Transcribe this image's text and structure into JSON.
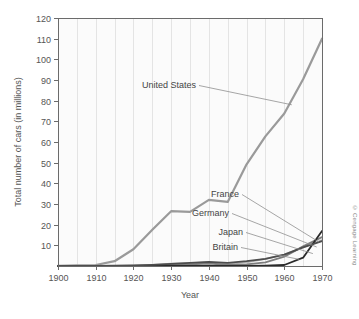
{
  "chart_data": {
    "type": "line",
    "title": "",
    "xlabel": "Year",
    "ylabel": "Total number of cars (in millions)",
    "xlim": [
      1900,
      1970
    ],
    "ylim": [
      0,
      120
    ],
    "xticks": [
      1900,
      1910,
      1920,
      1930,
      1940,
      1950,
      1960,
      1970
    ],
    "yticks": [
      10,
      20,
      30,
      40,
      50,
      60,
      70,
      80,
      90,
      100,
      110,
      120
    ],
    "grid": "vertical-minor-every-5-years",
    "legend": "inline-annotations",
    "x": [
      1900,
      1905,
      1910,
      1915,
      1920,
      1925,
      1930,
      1935,
      1940,
      1945,
      1950,
      1955,
      1960,
      1965,
      1970
    ],
    "series": [
      {
        "name": "United States",
        "color": "#9a9a9a",
        "width": 2.2,
        "values": [
          0.1,
          0.3,
          0.5,
          2.3,
          8.1,
          17.5,
          26.5,
          26.2,
          32.0,
          31.0,
          49.2,
          62.7,
          73.8,
          90.4,
          110.0
        ],
        "label": "United States",
        "label_x": 196,
        "label_y": 88
      },
      {
        "name": "France",
        "color": "#b7b7b7",
        "width": 1.8,
        "values": [
          0.0,
          0.0,
          0.1,
          0.1,
          0.2,
          0.5,
          1.1,
          1.4,
          1.7,
          1.0,
          1.8,
          3.5,
          5.5,
          9.0,
          12.5
        ],
        "label": "France",
        "label_x": 239,
        "label_y": 197
      },
      {
        "name": "Germany",
        "color": "#7d7d7d",
        "width": 1.8,
        "values": [
          0.0,
          0.0,
          0.05,
          0.07,
          0.1,
          0.2,
          0.5,
          0.8,
          1.2,
          0.6,
          0.8,
          1.8,
          4.5,
          9.5,
          14.0
        ],
        "label": "Germany",
        "label_x": 229,
        "label_y": 216
      },
      {
        "name": "Japan",
        "color": "#2a2a2a",
        "width": 1.8,
        "values": [
          0.0,
          0.0,
          0.0,
          0.0,
          0.02,
          0.03,
          0.05,
          0.08,
          0.1,
          0.05,
          0.1,
          0.2,
          0.5,
          4.0,
          17.0
        ],
        "label": "Japan",
        "label_x": 243,
        "label_y": 235
      },
      {
        "name": "Britain",
        "color": "#4d4d4d",
        "width": 1.8,
        "values": [
          0.01,
          0.03,
          0.1,
          0.2,
          0.3,
          0.6,
          1.0,
          1.5,
          2.0,
          1.5,
          2.3,
          3.5,
          5.5,
          9.0,
          12.0
        ],
        "label": "Britain",
        "label_x": 238,
        "label_y": 250
      }
    ]
  },
  "axes": {
    "y_title": "Total number of cars (in millions)",
    "x_title": "Year",
    "y_tick_labels": [
      "120",
      "110",
      "100",
      "90",
      "80",
      "70",
      "60",
      "50",
      "40",
      "30",
      "20",
      "10"
    ],
    "x_tick_labels": [
      "1900",
      "1910",
      "1920",
      "1930",
      "1940",
      "1950",
      "1960",
      "1970"
    ]
  },
  "annotations": {
    "united_states": "United States",
    "france": "France",
    "germany": "Germany",
    "japan": "Japan",
    "britain": "Britain"
  },
  "credit": {
    "text": "© Cengage Learning"
  },
  "colors": {
    "plot_background": "#fbfbfb",
    "grid": "#e6e6e6",
    "axis": "#6b6b6b",
    "text": "#555555"
  }
}
